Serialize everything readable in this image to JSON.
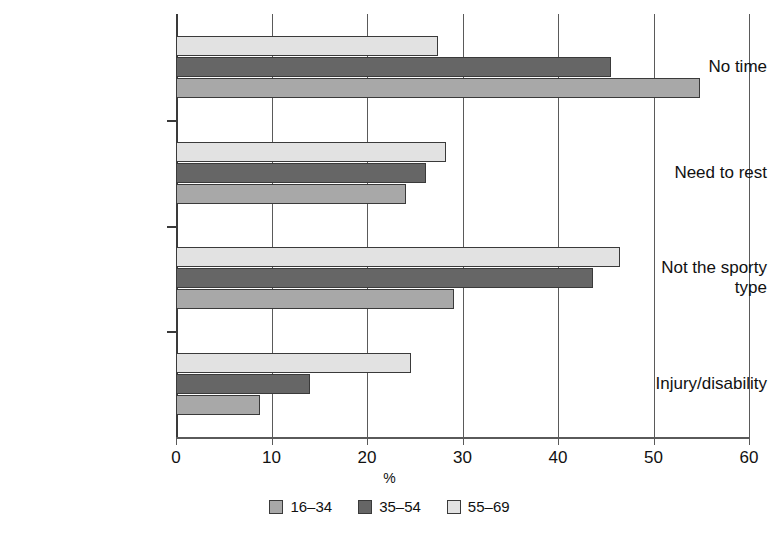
{
  "chart_data": {
    "type": "bar",
    "orientation": "horizontal",
    "title": "",
    "xlabel": "%",
    "ylabel": "",
    "xlim": [
      0,
      60
    ],
    "xticks": [
      0,
      10,
      20,
      30,
      40,
      50,
      60
    ],
    "grid": true,
    "legend_position": "bottom",
    "categories": [
      "No time",
      "Need to rest",
      "Not the sporty\ntype",
      "Injury/disability"
    ],
    "series": [
      {
        "name": "16–34",
        "color": "#a8a8a8",
        "values": [
          54.9,
          24.1,
          29.1,
          8.8
        ]
      },
      {
        "name": "35–54",
        "color": "#666666",
        "values": [
          45.6,
          26.2,
          43.7,
          14.0
        ]
      },
      {
        "name": "55–69",
        "color": "#e2e2e2",
        "values": [
          27.4,
          28.3,
          46.5,
          24.6
        ]
      }
    ]
  },
  "axis": {
    "x_title": "%",
    "tick_labels": [
      "0",
      "10",
      "20",
      "30",
      "40",
      "50",
      "60"
    ]
  },
  "legend": {
    "items": [
      {
        "label": "16–34",
        "color": "#a8a8a8"
      },
      {
        "label": "35–54",
        "color": "#666666"
      },
      {
        "label": "55–69",
        "color": "#e2e2e2"
      }
    ]
  },
  "categories": [
    {
      "label": "No time"
    },
    {
      "label": "Need to rest"
    },
    {
      "label": "Not the sporty\ntype"
    },
    {
      "label": "Injury/disability"
    }
  ]
}
